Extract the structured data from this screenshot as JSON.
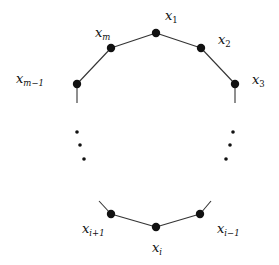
{
  "diagram": {
    "type": "cycle-polygon",
    "colors": {
      "edge": "#333333",
      "node": "#111111",
      "label": "#111111",
      "background": "#ffffff"
    },
    "nodes": [
      {
        "id": "x1",
        "base": "x",
        "sub": "1",
        "cx": 156,
        "cy": 33,
        "lx": 165,
        "ly": 20
      },
      {
        "id": "x2",
        "base": "x",
        "sub": "2",
        "cx": 201,
        "cy": 48,
        "lx": 218,
        "ly": 44
      },
      {
        "id": "x3",
        "base": "x",
        "sub": "3",
        "cx": 235,
        "cy": 84,
        "lx": 252,
        "ly": 84
      },
      {
        "id": "xm",
        "base": "x",
        "sub": "m",
        "cx": 111,
        "cy": 48,
        "lx": 95,
        "ly": 37
      },
      {
        "id": "xm-1",
        "base": "x",
        "sub": "m−1",
        "cx": 77,
        "cy": 84,
        "lx": 16,
        "ly": 83
      },
      {
        "id": "xi+1",
        "base": "x",
        "sub": "i+1",
        "cx": 111,
        "cy": 214,
        "lx": 82,
        "ly": 233
      },
      {
        "id": "xi",
        "base": "x",
        "sub": "i",
        "cx": 156,
        "cy": 227,
        "lx": 152,
        "ly": 252
      },
      {
        "id": "xi-1",
        "base": "x",
        "sub": "i−1",
        "cx": 200,
        "cy": 214,
        "lx": 217,
        "ly": 233
      }
    ],
    "edges": [
      {
        "from": "xm-1",
        "to": "xm"
      },
      {
        "from": "xm",
        "to": "x1"
      },
      {
        "from": "x1",
        "to": "x2"
      },
      {
        "from": "x2",
        "to": "x3"
      },
      {
        "from": "xi+1",
        "to": "xi"
      },
      {
        "from": "xi",
        "to": "xi-1"
      }
    ],
    "stubs": [
      {
        "x1": 77,
        "y1": 84,
        "x2": 77,
        "y2": 103
      },
      {
        "x1": 235,
        "y1": 84,
        "x2": 235,
        "y2": 103
      },
      {
        "x1": 111,
        "y1": 214,
        "x2": 99,
        "y2": 201
      },
      {
        "x1": 200,
        "y1": 214,
        "x2": 211,
        "y2": 201
      }
    ],
    "ellipsis_dots": {
      "left": [
        [
          77,
          132
        ],
        [
          80,
          145
        ],
        [
          84,
          159
        ]
      ],
      "right": [
        [
          233,
          132
        ],
        [
          230,
          145
        ],
        [
          226,
          159
        ]
      ]
    }
  }
}
